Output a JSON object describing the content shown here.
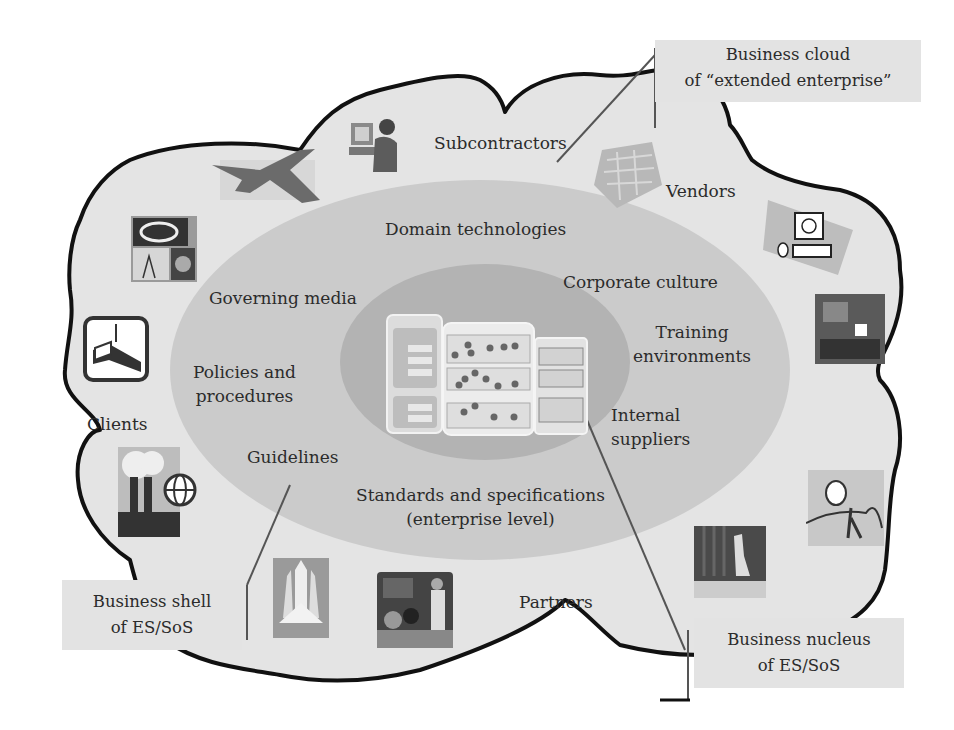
{
  "diagram": {
    "colors": {
      "cloud_fill": "#e4e4e4",
      "cloud_outline": "#111111",
      "shell_ellipse": "#cbcbcb",
      "nucleus_ellipse": "#b2b2b2",
      "callout_fill": "#e3e3e3",
      "leader_line": "#555555"
    },
    "callouts": {
      "cloud": {
        "line1": "Business cloud",
        "line2": "of “extended enterprise”"
      },
      "shell": {
        "line1": "Business shell",
        "line2": "of ES/SoS"
      },
      "nucleus": {
        "line1": "Business nucleus",
        "line2": "of ES/SoS"
      }
    },
    "cloud_labels": {
      "subcontractors": "Subcontractors",
      "vendors": "Vendors",
      "clients": "Clients",
      "partners": "Partners"
    },
    "shell_labels": {
      "domain_technologies": "Domain technologies",
      "corporate_culture": "Corporate culture",
      "governing_media": "Governing media",
      "training_line1": "Training",
      "training_line2": "environments",
      "policies_line1": "Policies and",
      "policies_line2": "procedures",
      "internal_line1": "Internal",
      "internal_line2": "suppliers",
      "guidelines": "Guidelines",
      "standards_line1": "Standards and specifications",
      "standards_line2": "(enterprise level)"
    },
    "nucleus_core": {
      "panel1_title": "Projects of ES",
      "panel2_title": "Employees of ES",
      "panel3_title": "Business units of ES",
      "panel3_items": [
        "TU ZAP",
        "TU IT",
        "TU Computer & Networks"
      ]
    },
    "icons": [
      "fighter-jet-icon",
      "person-at-computer-icon",
      "circuit-board-icon",
      "computer-network-icon",
      "astronomy-icon",
      "construction-beam-icon",
      "factory-globe-icon",
      "team-meeting-photo-icon",
      "creative-figure-icon",
      "stage-presentation-icon",
      "space-shuttle-icon",
      "teacher-students-icon"
    ]
  }
}
